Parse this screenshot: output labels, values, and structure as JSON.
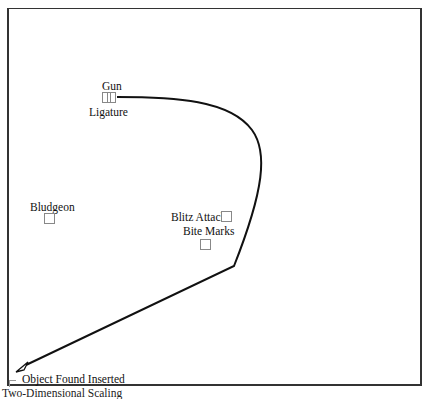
{
  "diagram": {
    "nodes": [
      {
        "id": "gun",
        "label": "Gun"
      },
      {
        "id": "ligature",
        "label": "Ligature"
      },
      {
        "id": "bludgeon",
        "label": "Bludgeon"
      },
      {
        "id": "blitz_attack",
        "label": "Blitz Attack"
      },
      {
        "id": "bite_marks",
        "label": "Bite Marks"
      },
      {
        "id": "object_found_inserted",
        "label": "Object Found Inserted"
      }
    ],
    "edges": [
      {
        "from": "gun",
        "to": "object_found_inserted",
        "style": "curved-arrow"
      }
    ],
    "caption": "Two-Dimensional Scaling"
  },
  "colors": {
    "line": "#111111",
    "frame": "#333333",
    "node_border": "#888888",
    "background": "#ffffff"
  }
}
